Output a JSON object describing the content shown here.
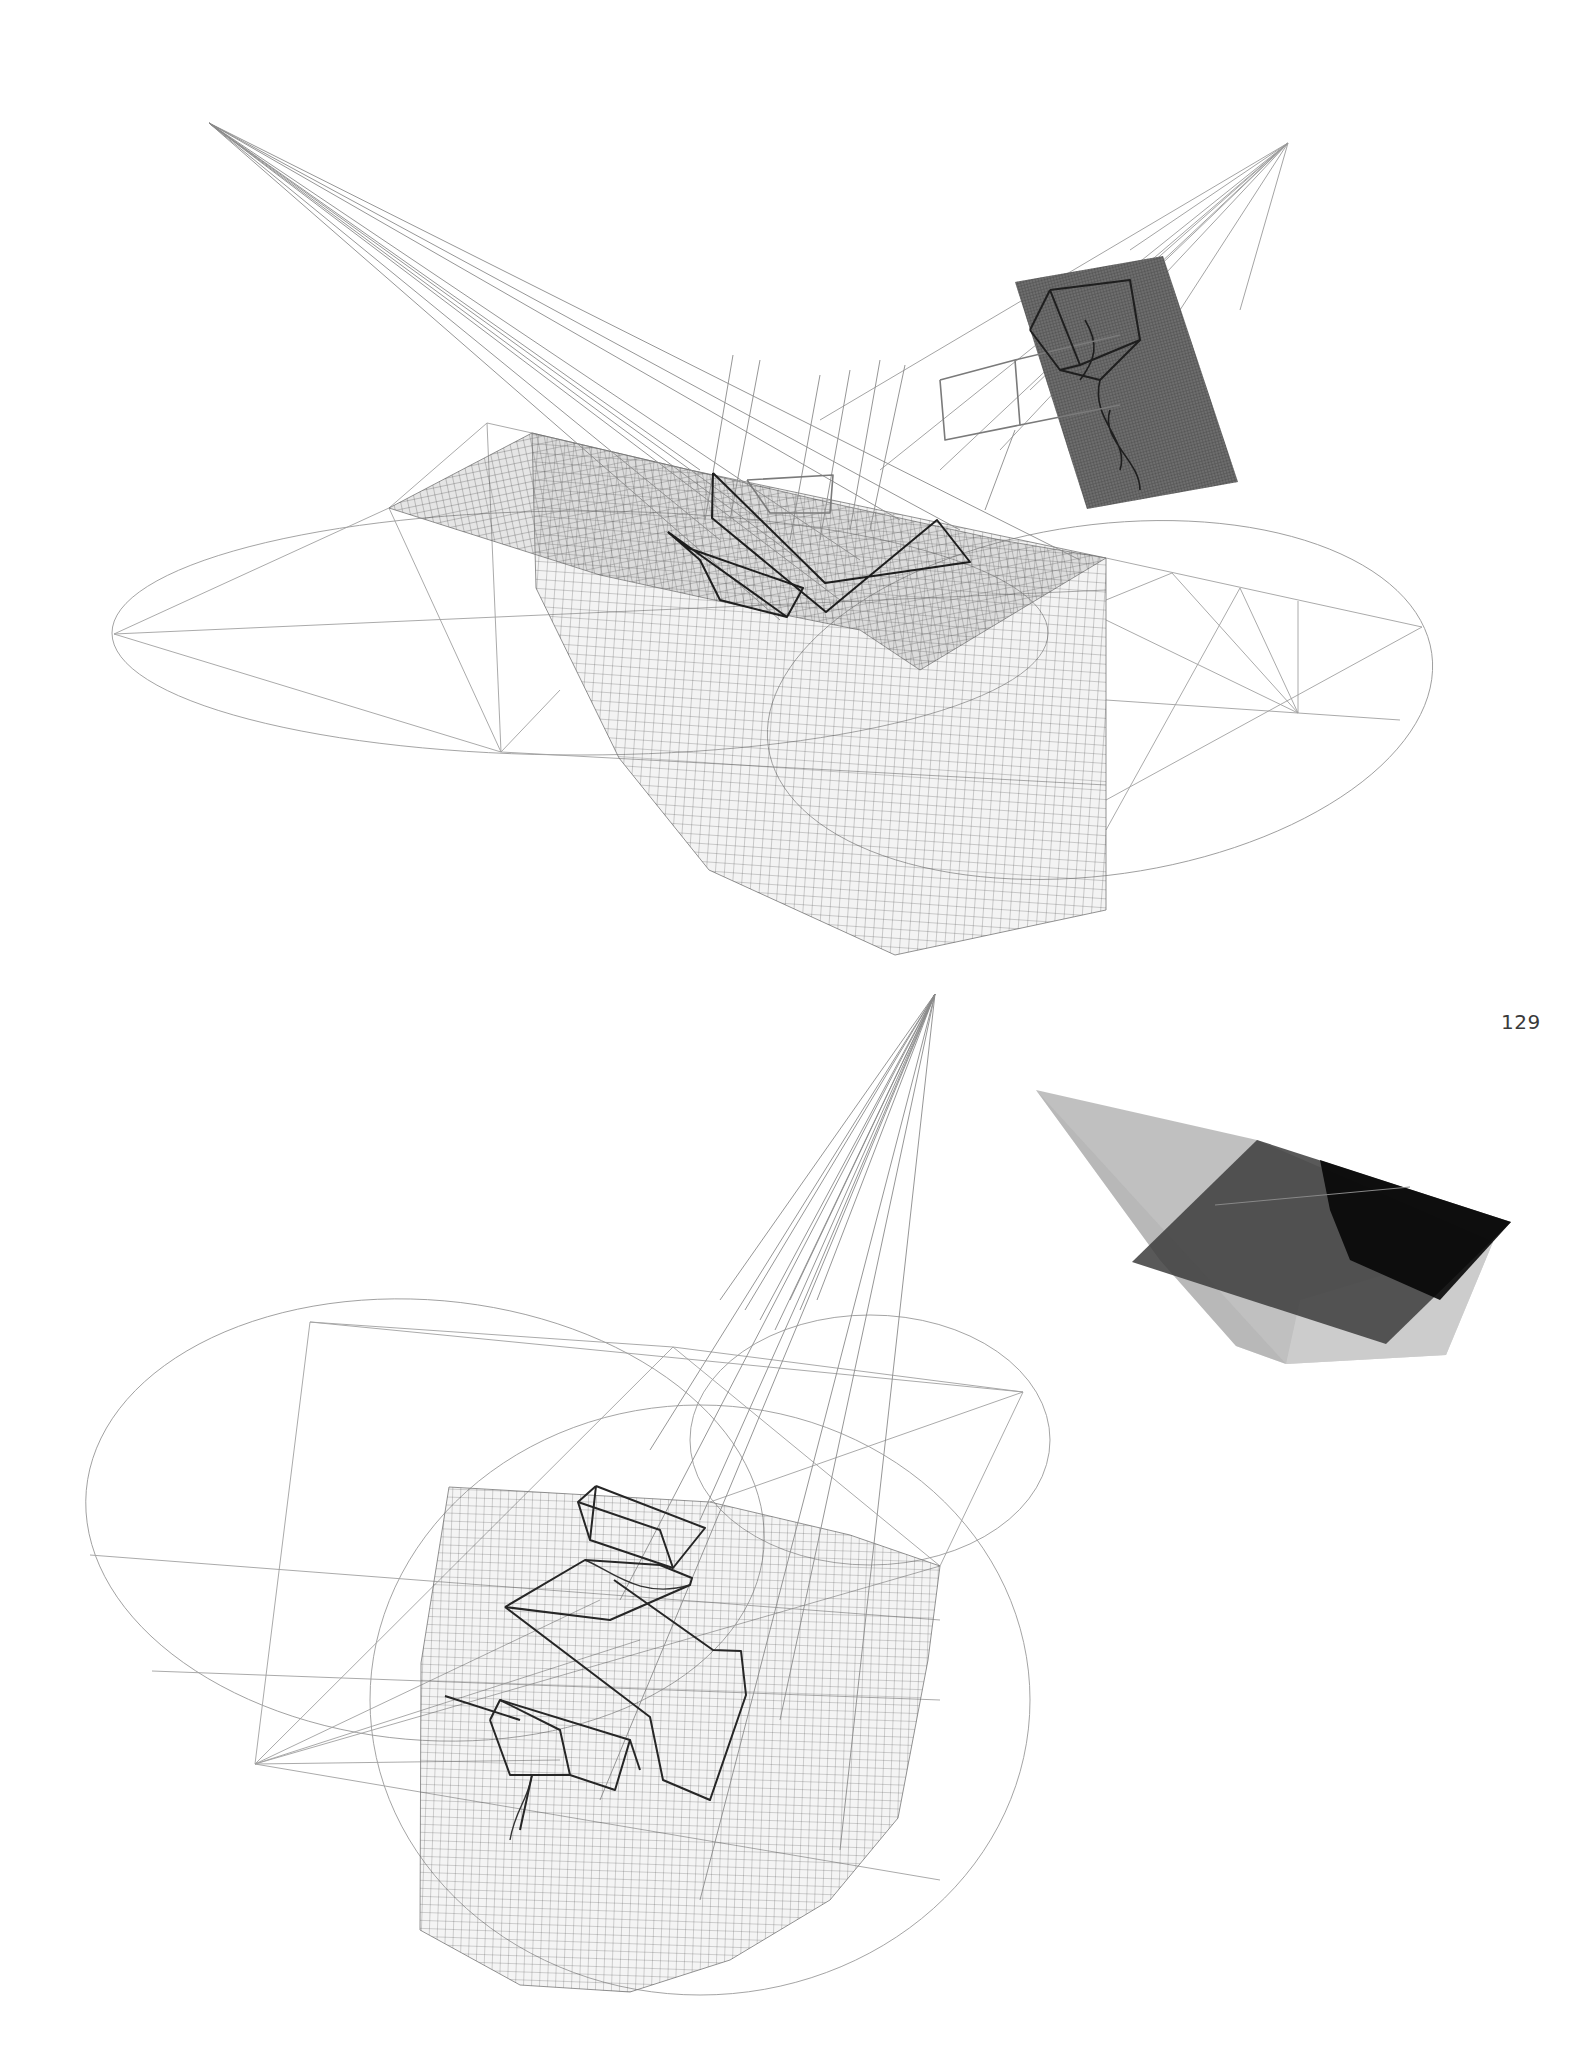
{
  "page": {
    "number": "129",
    "background": "#ffffff"
  },
  "figures": [
    {
      "id": "top-wireframe-drawing",
      "description": "Perspective wireframe drawing: fan of projection lines from upper-left apex onto a meshed terrain surface inside an elliptical construction frame, with a second fan onto a dark meshed panel at upper right",
      "apexes": [
        [
          209,
          123
        ],
        [
          1288,
          143
        ]
      ],
      "ellipses": [
        {
          "cx": 580,
          "cy": 633,
          "rx": 468,
          "ry": 122,
          "rot": 0
        },
        {
          "cx": 1100,
          "cy": 700,
          "rx": 335,
          "ry": 175,
          "rot": -8
        }
      ],
      "construction_lines": [
        [
          [
            114,
            634
          ],
          [
            389,
            508
          ]
        ],
        [
          [
            114,
            634
          ],
          [
            501,
            752
          ]
        ],
        [
          [
            114,
            634
          ],
          [
            1106,
            590
          ]
        ],
        [
          [
            389,
            508
          ],
          [
            501,
            752
          ]
        ],
        [
          [
            487,
            423
          ],
          [
            501,
            752
          ]
        ],
        [
          [
            389,
            508
          ],
          [
            487,
            423
          ]
        ],
        [
          [
            487,
            423
          ],
          [
            532,
            433
          ]
        ],
        [
          [
            501,
            752
          ],
          [
            1106,
            785
          ]
        ],
        [
          [
            501,
            752
          ],
          [
            560,
            690
          ]
        ],
        [
          [
            1106,
            558
          ],
          [
            1422,
            627
          ]
        ],
        [
          [
            1106,
            620
          ],
          [
            1298,
            713
          ]
        ],
        [
          [
            1106,
            700
          ],
          [
            1298,
            713
          ]
        ],
        [
          [
            1172,
            573
          ],
          [
            1298,
            713
          ]
        ],
        [
          [
            1240,
            588
          ],
          [
            1298,
            713
          ]
        ],
        [
          [
            1298,
            601
          ],
          [
            1298,
            713
          ]
        ],
        [
          [
            1298,
            713
          ],
          [
            1400,
            720
          ]
        ],
        [
          [
            1106,
            800
          ],
          [
            1422,
            627
          ]
        ],
        [
          [
            1106,
            830
          ],
          [
            1240,
            588
          ]
        ],
        [
          [
            1106,
            600
          ],
          [
            1172,
            573
          ]
        ]
      ],
      "mesh_surfaces": [
        {
          "points": [
            [
              389,
              508
            ],
            [
              532,
              433
            ],
            [
              690,
              470
            ],
            [
              840,
              505
            ],
            [
              1000,
              540
            ],
            [
              1106,
              558
            ],
            [
              920,
              670
            ],
            [
              860,
              630
            ],
            [
              760,
              610
            ],
            [
              600,
              575
            ]
          ],
          "fill": "#7a7a7a",
          "opacity": 0.55,
          "mesh": 7
        },
        {
          "points": [
            [
              532,
              433
            ],
            [
              690,
              470
            ],
            [
              1106,
              558
            ],
            [
              1106,
              910
            ],
            [
              895,
              955
            ],
            [
              709,
              870
            ],
            [
              619,
              758
            ],
            [
              536,
              588
            ]
          ],
          "fill": "#9a9a9a",
          "opacity": 0.35,
          "mesh": 9
        }
      ],
      "dark_panel": {
        "points": [
          [
            1015,
            282
          ],
          [
            1163,
            256
          ],
          [
            1238,
            482
          ],
          [
            1087,
            509
          ]
        ],
        "fill": "#6e6e6e"
      },
      "wireframes_dark": [
        [
          [
            713,
            473
          ],
          [
            712,
            518
          ],
          [
            826,
            612
          ],
          [
            937,
            520
          ],
          [
            970,
            562
          ],
          [
            825,
            583
          ],
          [
            713,
            473
          ]
        ],
        [
          [
            668,
            532
          ],
          [
            787,
            617
          ],
          [
            803,
            588
          ],
          [
            688,
            548
          ],
          [
            668,
            532
          ]
        ],
        [
          [
            668,
            532
          ],
          [
            700,
            560
          ],
          [
            720,
            600
          ],
          [
            787,
            617
          ]
        ],
        [
          [
            1050,
            290
          ],
          [
            1130,
            280
          ],
          [
            1140,
            340
          ],
          [
            1080,
            365
          ],
          [
            1050,
            290
          ]
        ],
        [
          [
            1030,
            330
          ],
          [
            1050,
            290
          ]
        ],
        [
          [
            1030,
            330
          ],
          [
            1060,
            370
          ],
          [
            1080,
            365
          ]
        ],
        [
          [
            1060,
            370
          ],
          [
            1100,
            380
          ],
          [
            1140,
            340
          ]
        ]
      ],
      "wireframes_light": [
        [
          [
            747,
            480
          ],
          [
            833,
            475
          ],
          [
            830,
            513
          ],
          [
            770,
            513
          ],
          [
            747,
            480
          ]
        ],
        [
          [
            940,
            380
          ],
          [
            1015,
            360
          ],
          [
            1020,
            425
          ],
          [
            945,
            440
          ],
          [
            940,
            380
          ]
        ],
        [
          [
            1015,
            360
          ],
          [
            1120,
            335
          ]
        ],
        [
          [
            1020,
            425
          ],
          [
            1120,
            405
          ]
        ]
      ],
      "vertical_lines": [
        [
          [
            733,
            355
          ],
          [
            705,
            520
          ]
        ],
        [
          [
            760,
            360
          ],
          [
            730,
            520
          ]
        ],
        [
          [
            820,
            375
          ],
          [
            790,
            540
          ]
        ],
        [
          [
            850,
            370
          ],
          [
            820,
            540
          ]
        ],
        [
          [
            880,
            360
          ],
          [
            850,
            530
          ]
        ],
        [
          [
            905,
            365
          ],
          [
            870,
            530
          ]
        ],
        [
          [
            1015,
            430
          ],
          [
            985,
            510
          ]
        ]
      ]
    },
    {
      "id": "shaded-render",
      "description": "Translucent grey shaded volumetric rendering with a dark tilted plane",
      "polygons": [
        {
          "points": [
            [
              1036,
              1090
            ],
            [
              1257,
              1140
            ],
            [
              1493,
              1242
            ],
            [
              1446,
              1355
            ],
            [
              1286,
              1364
            ],
            [
              1236,
              1346
            ],
            [
              1160,
              1260
            ]
          ],
          "fill": "#8c8c8c",
          "opacity": 0.55
        },
        {
          "points": [
            [
              1036,
              1090
            ],
            [
              1160,
              1260
            ],
            [
              1236,
              1346
            ],
            [
              1286,
              1364
            ]
          ],
          "fill": "#b0b0b0",
          "opacity": 0.5
        },
        {
          "points": [
            [
              1286,
              1364
            ],
            [
              1446,
              1355
            ],
            [
              1493,
              1242
            ],
            [
              1300,
              1300
            ]
          ],
          "fill": "#d2d2d2",
          "opacity": 0.7
        },
        {
          "points": [
            [
              1257,
              1140
            ],
            [
              1511,
              1222
            ],
            [
              1386,
              1344
            ],
            [
              1132,
              1262
            ]
          ],
          "fill": "#3c3c3c",
          "opacity": 0.85
        },
        {
          "points": [
            [
              1320,
              1160
            ],
            [
              1511,
              1222
            ],
            [
              1440,
              1300
            ],
            [
              1350,
              1260
            ],
            [
              1330,
              1210
            ]
          ],
          "fill": "#050505",
          "opacity": 0.9
        }
      ]
    },
    {
      "id": "bottom-wireframe-drawing",
      "description": "Perspective wireframe drawing: fan of projection lines from upper apex onto a rectangular mesh inside two intersecting elliptical construction frames",
      "apexes": [
        [
          935,
          994
        ]
      ],
      "ellipses": [
        {
          "cx": 425,
          "cy": 1520,
          "rx": 340,
          "ry": 220,
          "rot": 5
        },
        {
          "cx": 870,
          "cy": 1440,
          "rx": 180,
          "ry": 125,
          "rot": 0
        },
        {
          "cx": 700,
          "cy": 1700,
          "rx": 330,
          "ry": 295,
          "rot": 0
        }
      ],
      "construction_lines": [
        [
          [
            310,
            1322
          ],
          [
            673,
            1347
          ]
        ],
        [
          [
            310,
            1322
          ],
          [
            255,
            1764
          ]
        ],
        [
          [
            310,
            1322
          ],
          [
            1023,
            1392
          ]
        ],
        [
          [
            673,
            1347
          ],
          [
            1023,
            1392
          ]
        ],
        [
          [
            673,
            1347
          ],
          [
            940,
            1566
          ]
        ],
        [
          [
            673,
            1347
          ],
          [
            255,
            1764
          ]
        ],
        [
          [
            1023,
            1392
          ],
          [
            940,
            1566
          ]
        ],
        [
          [
            1023,
            1392
          ],
          [
            710,
            1502
          ]
        ],
        [
          [
            90,
            1555
          ],
          [
            940,
            1620
          ]
        ],
        [
          [
            152,
            1671
          ],
          [
            940,
            1700
          ]
        ],
        [
          [
            255,
            1764
          ],
          [
            940,
            1566
          ]
        ],
        [
          [
            255,
            1764
          ],
          [
            600,
            1600
          ]
        ],
        [
          [
            255,
            1764
          ],
          [
            640,
            1640
          ]
        ],
        [
          [
            255,
            1764
          ],
          [
            560,
            1760
          ]
        ],
        [
          [
            255,
            1764
          ],
          [
            940,
            1880
          ]
        ]
      ],
      "mesh_surfaces": [
        {
          "points": [
            [
              449,
              1487
            ],
            [
              710,
              1502
            ],
            [
              850,
              1535
            ],
            [
              940,
              1566
            ],
            [
              928,
              1660
            ],
            [
              898,
              1818
            ],
            [
              830,
              1900
            ],
            [
              730,
              1960
            ],
            [
              630,
              1992
            ],
            [
              520,
              1985
            ],
            [
              420,
              1930
            ],
            [
              421,
              1663
            ]
          ],
          "fill": "#9a9a9a",
          "opacity": 0.32,
          "mesh": 8
        }
      ],
      "wireframes_dark": [
        [
          [
            596,
            1486
          ],
          [
            705,
            1528
          ],
          [
            673,
            1568
          ],
          [
            590,
            1540
          ],
          [
            596,
            1486
          ]
        ],
        [
          [
            596,
            1486
          ],
          [
            578,
            1502
          ],
          [
            590,
            1540
          ]
        ],
        [
          [
            578,
            1502
          ],
          [
            660,
            1530
          ],
          [
            673,
            1568
          ]
        ],
        [
          [
            505,
            1607
          ],
          [
            585,
            1560
          ],
          [
            660,
            1565
          ],
          [
            692,
            1578
          ],
          [
            690,
            1585
          ],
          [
            610,
            1620
          ],
          [
            505,
            1607
          ]
        ],
        [
          [
            505,
            1607
          ],
          [
            650,
            1717
          ],
          [
            663,
            1780
          ],
          [
            710,
            1800
          ],
          [
            746,
            1695
          ],
          [
            741,
            1651
          ],
          [
            713,
            1650
          ],
          [
            614,
            1580
          ]
        ],
        [
          [
            490,
            1720
          ],
          [
            500,
            1700
          ],
          [
            560,
            1730
          ],
          [
            570,
            1775
          ],
          [
            510,
            1775
          ],
          [
            490,
            1720
          ]
        ],
        [
          [
            500,
            1700
          ],
          [
            630,
            1740
          ],
          [
            615,
            1790
          ],
          [
            570,
            1775
          ]
        ],
        [
          [
            630,
            1740
          ],
          [
            640,
            1770
          ]
        ],
        [
          [
            445,
            1696
          ],
          [
            520,
            1720
          ]
        ],
        [
          [
            532,
            1775
          ],
          [
            520,
            1830
          ]
        ]
      ],
      "fan_targets": [
        [
          720,
          1300
        ],
        [
          745,
          1310
        ],
        [
          760,
          1320
        ],
        [
          775,
          1330
        ],
        [
          790,
          1300
        ],
        [
          800,
          1310
        ],
        [
          817,
          1300
        ],
        [
          650,
          1450
        ],
        [
          700,
          1520
        ],
        [
          620,
          1600
        ],
        [
          780,
          1720
        ],
        [
          840,
          1850
        ],
        [
          700,
          1900
        ],
        [
          600,
          1800
        ]
      ]
    }
  ],
  "fan_sources": {
    "top_left_targets": [
      [
        760,
        520
      ],
      [
        800,
        560
      ],
      [
        860,
        560
      ],
      [
        900,
        520
      ],
      [
        960,
        530
      ],
      [
        1080,
        560
      ],
      [
        720,
        540
      ],
      [
        700,
        470
      ],
      [
        780,
        620
      ],
      [
        840,
        600
      ]
    ],
    "top_right_targets": [
      [
        820,
        420
      ],
      [
        880,
        470
      ],
      [
        940,
        470
      ],
      [
        1000,
        450
      ],
      [
        1030,
        390
      ],
      [
        1070,
        330
      ],
      [
        1110,
        300
      ],
      [
        1130,
        250
      ],
      [
        1180,
        310
      ],
      [
        1240,
        310
      ]
    ]
  }
}
